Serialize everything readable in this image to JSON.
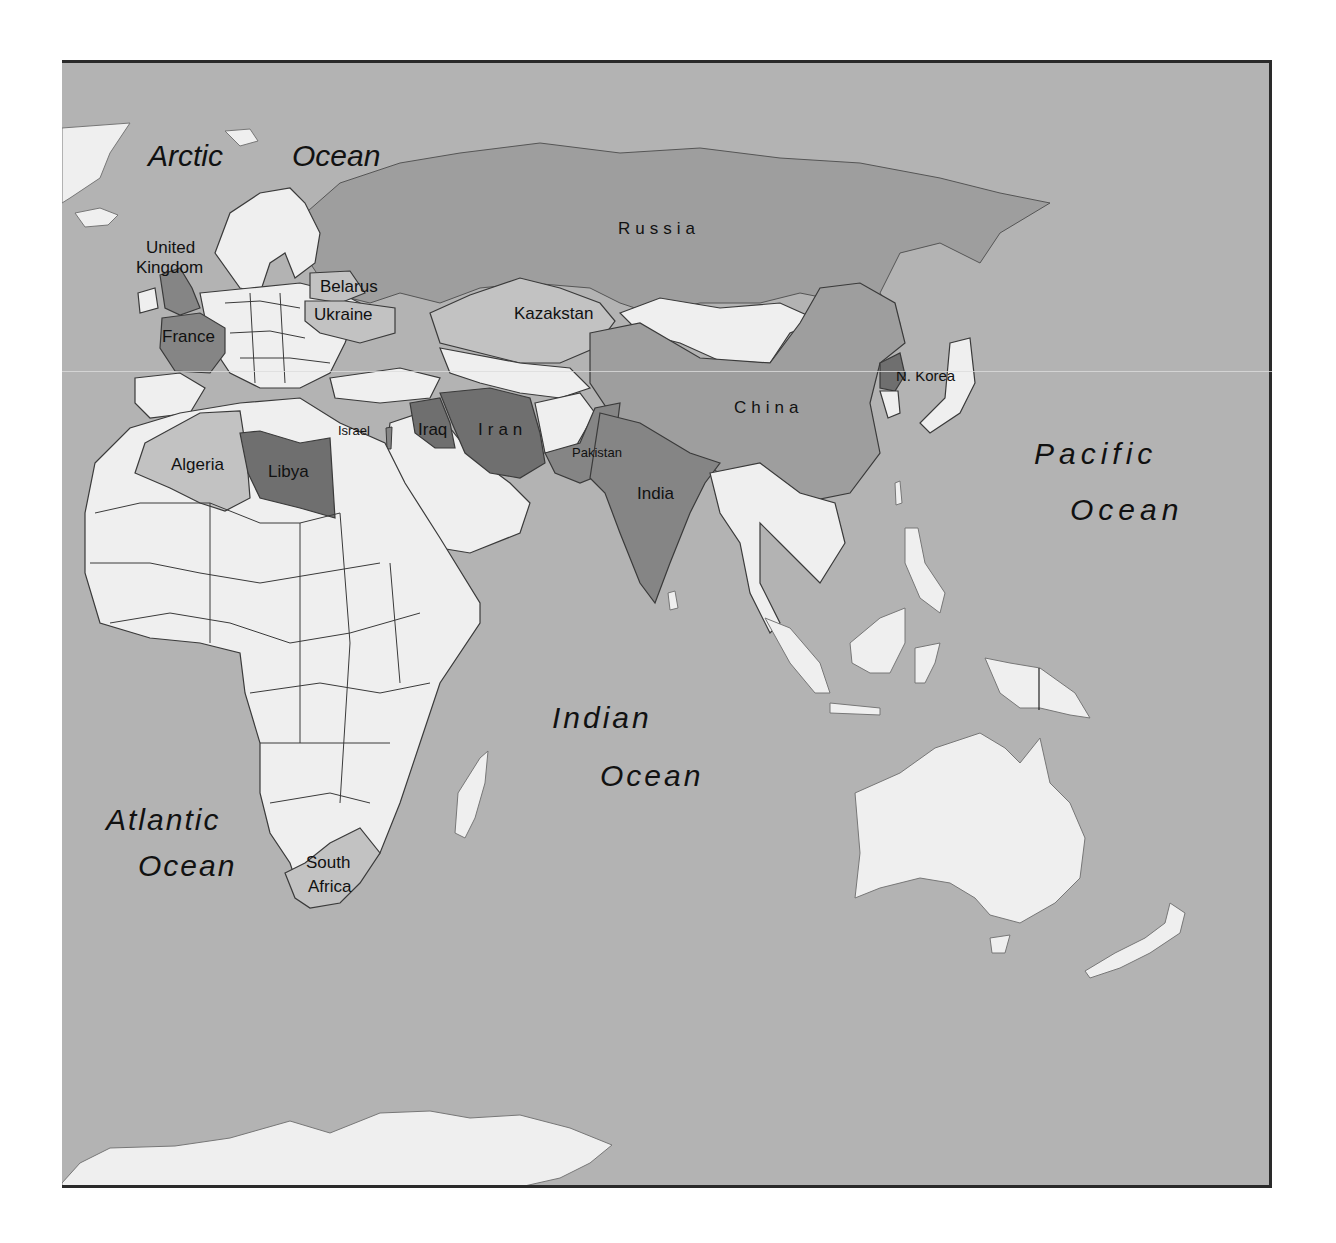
{
  "map": {
    "colors": {
      "ocean": "#b3b3b3",
      "land_default": "#efefef",
      "shade_light": "#c2c2c2",
      "shade_medium": "#9e9e9e",
      "shade_dark": "#858585",
      "shade_darkest": "#6f6f6f",
      "border": "#3a3a3a",
      "frame": "#2a2a2a"
    },
    "oceans": [
      {
        "id": "arctic",
        "label_1": "Arctic",
        "label_2": "Ocean"
      },
      {
        "id": "pacific",
        "label_1": "Pacific",
        "label_2": "Ocean"
      },
      {
        "id": "indian",
        "label_1": "Indian",
        "label_2": "Ocean"
      },
      {
        "id": "atlantic",
        "label_1": "Atlantic",
        "label_2": "Ocean"
      }
    ],
    "countries": [
      {
        "id": "uk",
        "label_1": "United",
        "label_2": "Kingdom",
        "shade": "dark"
      },
      {
        "id": "france",
        "label": "France",
        "shade": "dark"
      },
      {
        "id": "belarus",
        "label": "Belarus",
        "shade": "light"
      },
      {
        "id": "ukraine",
        "label": "Ukraine",
        "shade": "light"
      },
      {
        "id": "russia",
        "label": "Russia",
        "shade": "medium"
      },
      {
        "id": "kazakstan",
        "label": "Kazakstan",
        "shade": "light"
      },
      {
        "id": "china",
        "label": "China",
        "shade": "medium"
      },
      {
        "id": "nkorea",
        "label": "N. Korea",
        "shade": "darkest"
      },
      {
        "id": "israel",
        "label": "Israel",
        "shade": "dark"
      },
      {
        "id": "iraq",
        "label": "Iraq",
        "shade": "darkest"
      },
      {
        "id": "iran",
        "label": "Iran",
        "shade": "darkest"
      },
      {
        "id": "pakistan",
        "label": "Pakistan",
        "shade": "dark"
      },
      {
        "id": "india",
        "label": "India",
        "shade": "dark"
      },
      {
        "id": "algeria",
        "label": "Algeria",
        "shade": "light"
      },
      {
        "id": "libya",
        "label": "Libya",
        "shade": "darkest"
      },
      {
        "id": "south_africa",
        "label_1": "South",
        "label_2": "Africa",
        "shade": "light"
      }
    ]
  }
}
